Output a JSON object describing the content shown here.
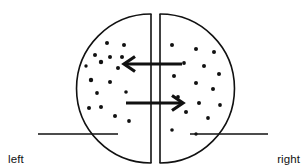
{
  "figure": {
    "name": "membrane-diffusion-diagram",
    "background_color": "#ffffff",
    "stroke_color": "#111111",
    "width": 306,
    "height": 168
  },
  "labels": {
    "left": {
      "line1": "left",
      "line2": "side"
    },
    "right": {
      "line1": "right",
      "line2": "side"
    }
  },
  "chart_data": {
    "type": "diagram",
    "title": "",
    "container": {
      "shape": "circle",
      "center_x": 155,
      "center_y": 88,
      "radius": 74,
      "stroke_width": 1.6
    },
    "divider": {
      "type": "vertical-slit",
      "left_line_x": 151,
      "right_line_x": 160,
      "top_y": 14,
      "bottom_y": 163,
      "stroke_width": 1.6
    },
    "arrows": [
      {
        "name": "leftward-flux-arrow",
        "direction": "left",
        "y": 64,
        "x_start": 182,
        "x_end": 124,
        "stroke_width": 3.2
      },
      {
        "name": "rightward-flux-arrow",
        "direction": "right",
        "y": 103,
        "x_start": 126,
        "x_end": 183,
        "stroke_width": 3.2
      }
    ],
    "leader_lines": [
      {
        "name": "left-leader-line",
        "x1": 38,
        "x2": 118,
        "y": 134
      },
      {
        "name": "right-leader-line",
        "x1": 190,
        "x2": 268,
        "y": 134
      }
    ],
    "particles_left": [
      {
        "x": 107,
        "y": 43,
        "r": 2.0
      },
      {
        "x": 124,
        "y": 45,
        "r": 2.0
      },
      {
        "x": 95,
        "y": 55,
        "r": 2.0
      },
      {
        "x": 110,
        "y": 57,
        "r": 2.0
      },
      {
        "x": 122,
        "y": 57,
        "r": 2.0
      },
      {
        "x": 101,
        "y": 62,
        "r": 2.2
      },
      {
        "x": 118,
        "y": 68,
        "r": 2.0
      },
      {
        "x": 91,
        "y": 80,
        "r": 2.2
      },
      {
        "x": 110,
        "y": 82,
        "r": 2.0
      },
      {
        "x": 97,
        "y": 93,
        "r": 1.9
      },
      {
        "x": 126,
        "y": 92,
        "r": 1.8
      },
      {
        "x": 89,
        "y": 108,
        "r": 2.0
      },
      {
        "x": 101,
        "y": 107,
        "r": 2.0
      },
      {
        "x": 115,
        "y": 116,
        "r": 2.0
      },
      {
        "x": 129,
        "y": 121,
        "r": 1.9
      },
      {
        "x": 86,
        "y": 66,
        "r": 1.7
      }
    ],
    "particles_right": [
      {
        "x": 172,
        "y": 45,
        "r": 2.0
      },
      {
        "x": 196,
        "y": 49,
        "r": 2.0
      },
      {
        "x": 214,
        "y": 52,
        "r": 2.0
      },
      {
        "x": 184,
        "y": 63,
        "r": 1.9
      },
      {
        "x": 204,
        "y": 66,
        "r": 2.0
      },
      {
        "x": 174,
        "y": 76,
        "r": 2.0
      },
      {
        "x": 219,
        "y": 74,
        "r": 2.0
      },
      {
        "x": 196,
        "y": 83,
        "r": 2.0
      },
      {
        "x": 213,
        "y": 89,
        "r": 2.0
      },
      {
        "x": 178,
        "y": 97,
        "r": 1.9
      },
      {
        "x": 199,
        "y": 103,
        "r": 2.0
      },
      {
        "x": 220,
        "y": 105,
        "r": 1.9
      },
      {
        "x": 186,
        "y": 112,
        "r": 2.0
      },
      {
        "x": 208,
        "y": 118,
        "r": 1.9
      },
      {
        "x": 172,
        "y": 130,
        "r": 1.8
      },
      {
        "x": 196,
        "y": 134,
        "r": 1.7
      }
    ]
  }
}
